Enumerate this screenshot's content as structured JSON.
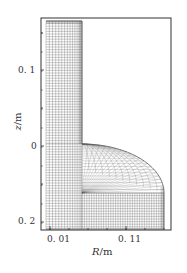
{
  "chart_data": {
    "type": "mesh",
    "title": "",
    "xlabel": "R/m",
    "xlabel_var": "R",
    "xlabel_unit": "/m",
    "ylabel": "z/m",
    "ylabel_var": "z",
    "ylabel_unit": "/m",
    "x_ticks": [
      {
        "value": 0.01,
        "label": "0. 01"
      },
      {
        "value": 0.11,
        "label": "0. 11"
      }
    ],
    "y_ticks": [
      {
        "value": 0.1,
        "label": "0. 1"
      },
      {
        "value": 0,
        "label": "0"
      },
      {
        "value": 0.2,
        "label": "0. 2"
      }
    ],
    "xlim": [
      0.0,
      0.17
    ],
    "ylim_top_to_bottom": [
      0.17,
      0.21
    ],
    "grid": false,
    "legend": null,
    "geometry": {
      "description": "Structured axisymmetric computational mesh: narrow vertical column on the left joined to a wider rounded bulge region at the bottom",
      "column": {
        "r_min": 0.0,
        "r_max": 0.047,
        "z_top": 0.165,
        "z_bottom": -0.205
      },
      "bulge": {
        "r_max": 0.155,
        "z_top_at_column": 0.0,
        "z_start_vertical_wall": -0.055,
        "z_bottom": -0.205
      },
      "colors": {
        "mesh_line": "#555555",
        "frame": "#333333",
        "background": "#ffffff"
      }
    }
  }
}
